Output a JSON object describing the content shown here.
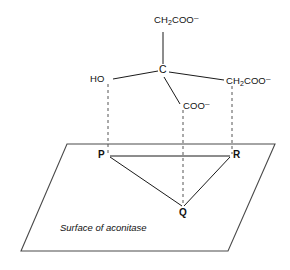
{
  "diagram": {
    "surface_caption": "Surface of aconitase",
    "central_atom": "C",
    "hydroxyl_label": "HO",
    "top_arm": {
      "formula": "CH",
      "sub": "2",
      "rest": "COO",
      "charge": "–"
    },
    "right_arm": {
      "formula": "CH",
      "sub": "2",
      "rest": "COO",
      "charge": "–"
    },
    "bottom_arm": {
      "rest": "COO",
      "charge": "–"
    },
    "binding_sites": [
      {
        "id": "P",
        "label": "P"
      },
      {
        "id": "Q",
        "label": "Q"
      },
      {
        "id": "R",
        "label": "R"
      }
    ],
    "colors": {
      "bond": "#1a1a1a",
      "projection": "#555555",
      "plane": "#4a4a4a",
      "background": "#ffffff"
    }
  }
}
